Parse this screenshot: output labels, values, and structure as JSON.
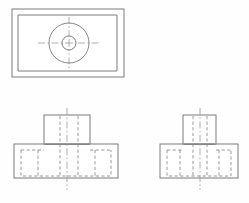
{
  "sheet": {
    "title": "Orthographic Projection Drawing",
    "width": 249,
    "height": 203,
    "background_color": "#fefefe",
    "visible_line_color": "#6e6e70",
    "hidden_line_color": "#8d8d90",
    "center_line_color": "#9a9a9e"
  },
  "views": {
    "top_view": {
      "label": "Top View",
      "outer_rect": {
        "x": 12,
        "y": 9,
        "width": 112,
        "height": 68
      },
      "inner_rect": {
        "x": 18,
        "y": 15,
        "width": 99,
        "height": 56
      },
      "outer_circle": {
        "cx": 69,
        "cy": 43,
        "r": 20
      },
      "inner_circle": {
        "cx": 69,
        "cy": 43,
        "r": 7
      },
      "horizontal_center_line": {
        "x1": 38,
        "y1": 43,
        "x2": 100,
        "y2": 43
      },
      "vertical_center_line": {
        "x1": 69,
        "y1": 17,
        "x2": 69,
        "y2": 69
      },
      "center_mark_size": 4
    },
    "front_view": {
      "label": "Front View",
      "base_rect": {
        "x": 14,
        "y": 144,
        "width": 104,
        "height": 34
      },
      "upper_rect": {
        "x": 44,
        "y": 115,
        "width": 46,
        "height": 29
      },
      "hidden_outline": {
        "x": 21,
        "y": 150,
        "width": 90,
        "height": 26
      },
      "hidden_vertical_lines_x": [
        38,
        60,
        78,
        95
      ],
      "hidden_upper_lines_x": [
        60,
        78
      ],
      "center_line": {
        "x1": 67,
        "y1": 108,
        "x2": 67,
        "y2": 190
      }
    },
    "side_view": {
      "label": "Side View",
      "base_rect": {
        "x": 160,
        "y": 144,
        "width": 78,
        "height": 34
      },
      "upper_rect": {
        "x": 183,
        "y": 115,
        "width": 33,
        "height": 29
      },
      "hidden_outline": {
        "x": 167,
        "y": 150,
        "width": 64,
        "height": 26
      },
      "hidden_vertical_lines_x": [
        180,
        193,
        207,
        219
      ],
      "hidden_upper_lines_x": [
        193,
        207
      ],
      "center_line": {
        "x1": 200,
        "y1": 108,
        "x2": 200,
        "y2": 190
      }
    }
  }
}
